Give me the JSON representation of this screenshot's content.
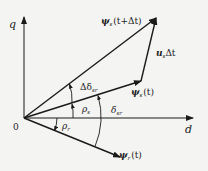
{
  "diagram": {
    "axes": {
      "q_label": "q",
      "d_label": "d",
      "origin_label": "0"
    },
    "vectors": {
      "psi_s_next": {
        "symbol": "ψ",
        "sub": "s",
        "arg": "(t+Δt)"
      },
      "psi_s": {
        "symbol": "ψ",
        "sub": "s",
        "arg": "(t)"
      },
      "psi_r": {
        "symbol": "ψ",
        "sub": "r",
        "arg": "(t)"
      },
      "u_s_dt": {
        "symbol": "u",
        "sub": "s",
        "suffix": "Δt"
      }
    },
    "angles": {
      "delta_delta_sr": {
        "symbol": "Δδ",
        "sub": "sr"
      },
      "rho_s": {
        "symbol": "ρ",
        "sub": "s"
      },
      "delta_sr": {
        "symbol": "δ",
        "sub": "sr"
      },
      "rho_r": {
        "symbol": "ρ",
        "sub": "r"
      }
    },
    "colors": {
      "line": "#1a1a1a",
      "background": "#f4f4f2"
    }
  }
}
